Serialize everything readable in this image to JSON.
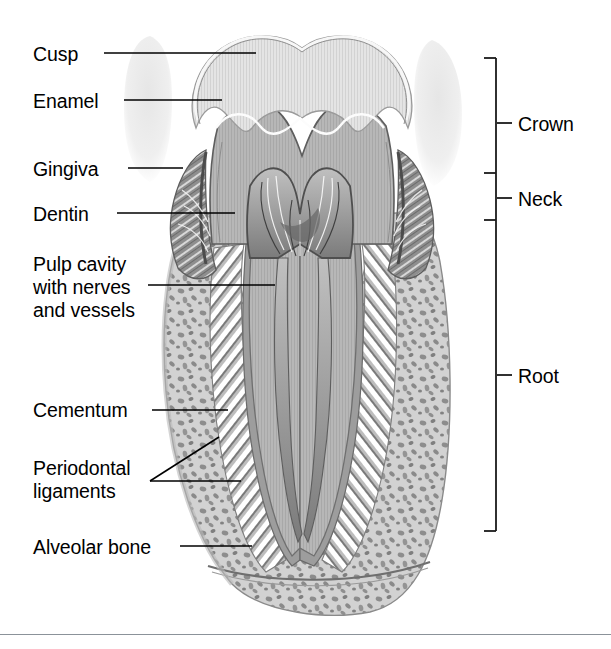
{
  "figure": {
    "width": 611,
    "height": 649,
    "background": "#ffffff",
    "rule_color": "#8b9299"
  },
  "labels_left": [
    {
      "id": "cusp",
      "text": "Cusp",
      "x": 33,
      "y": 43,
      "leader": {
        "x1": 104,
        "y1": 53,
        "x2": 256,
        "y2": 53
      }
    },
    {
      "id": "enamel",
      "text": "Enamel",
      "x": 33,
      "y": 90,
      "leader": {
        "x1": 124,
        "y1": 100,
        "x2": 222,
        "y2": 100
      }
    },
    {
      "id": "gingiva",
      "text": "Gingiva",
      "x": 33,
      "y": 158,
      "leader": {
        "x1": 128,
        "y1": 168,
        "x2": 183,
        "y2": 168
      }
    },
    {
      "id": "dentin",
      "text": "Dentin",
      "x": 33,
      "y": 203,
      "leader": {
        "x1": 117,
        "y1": 213,
        "x2": 235,
        "y2": 213
      }
    },
    {
      "id": "cementum",
      "text": "Cementum",
      "x": 33,
      "y": 399,
      "leader": {
        "x1": 152,
        "y1": 410,
        "x2": 228,
        "y2": 410
      }
    },
    {
      "id": "alveolarbone",
      "text": "Alveolar bone",
      "x": 33,
      "y": 536,
      "leader": {
        "x1": 180,
        "y1": 546,
        "x2": 252,
        "y2": 546
      }
    }
  ],
  "labels_left_multiline": [
    {
      "id": "pulp-cavity",
      "lines": [
        "Pulp cavity",
        "with nerves",
        "and vessels"
      ],
      "x": 33,
      "y": 253,
      "leader": {
        "x1": 148,
        "y1": 285,
        "x2": 275,
        "y2": 285
      }
    },
    {
      "id": "periodontal-ligaments",
      "lines": [
        "Periodontal",
        "ligaments"
      ],
      "x": 33,
      "y": 457,
      "leaders": [
        {
          "x1": 150,
          "y1": 481,
          "x2": 241,
          "y2": 481
        },
        {
          "x1": 150,
          "y1": 481,
          "x2": 219,
          "y2": 437
        }
      ]
    }
  ],
  "labels_right": [
    {
      "id": "crown",
      "text": "Crown",
      "x": 518,
      "y": 113,
      "tick": {
        "x1": 497,
        "y1": 123,
        "x2": 512,
        "y2": 123
      }
    },
    {
      "id": "neck",
      "text": "Neck",
      "x": 518,
      "y": 188,
      "tick": {
        "x1": 497,
        "y1": 198,
        "x2": 512,
        "y2": 198
      }
    },
    {
      "id": "root",
      "text": "Root",
      "x": 518,
      "y": 365,
      "tick": {
        "x1": 497,
        "y1": 375,
        "x2": 512,
        "y2": 375
      }
    }
  ],
  "bracket": {
    "color": "#1a1a1a",
    "spine_x": 496,
    "top_y": 58,
    "bottom_y": 531,
    "arm_length": 12,
    "divider_ticks": [
      {
        "id": "crown-neck",
        "y": 173
      },
      {
        "id": "neck-root",
        "y": 220
      }
    ]
  },
  "colors": {
    "enamel": "#e3e3e3",
    "enamel_edge": "#f4f4f4",
    "dentin": "#b5b5b5",
    "dentin_line": "#5a5a5a",
    "pulp": "#a0a0a0",
    "pulp_dark": "#6e6e6e",
    "gingiva": "#8a8a8a",
    "cementum": "#9c9c9c",
    "bone": "#cfcfcf",
    "bone_spongy": "#8f8f8f",
    "ligament": "#ffffff",
    "ghost_tooth": "#ededed",
    "leader": "#000000"
  },
  "structures": [
    {
      "id": "crown-enamel",
      "name": "Enamel layer of the crown"
    },
    {
      "id": "crown-dentin",
      "name": "Dentin body"
    },
    {
      "id": "pulp-chamber",
      "name": "Pulp cavity with nerves and vessels"
    },
    {
      "id": "gingiva-left",
      "name": "Gingiva (gum) left wedge"
    },
    {
      "id": "gingiva-right",
      "name": "Gingiva (gum) right wedge"
    },
    {
      "id": "root-left",
      "name": "Left root"
    },
    {
      "id": "root-right",
      "name": "Right root"
    },
    {
      "id": "cementum-layer",
      "name": "Cementum covering the root"
    },
    {
      "id": "periodontal-fibers",
      "name": "Periodontal ligament fibers"
    },
    {
      "id": "alveolar-bone-mass",
      "name": "Spongy alveolar bone"
    },
    {
      "id": "neighbor-tooth-left",
      "name": "Adjacent tooth, left"
    },
    {
      "id": "neighbor-tooth-right",
      "name": "Adjacent tooth, right"
    }
  ]
}
